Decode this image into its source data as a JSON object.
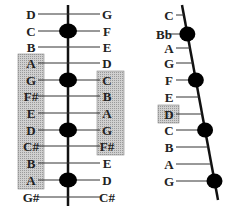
{
  "left_diagram": {
    "colors": {
      "line": "#111111",
      "dot": "#000000",
      "shade": "#c8c8c8",
      "text": "#222222"
    },
    "rows": [
      {
        "left": "D",
        "right": "G",
        "y": 14,
        "dot": false
      },
      {
        "left": "C",
        "right": "F",
        "y": 31,
        "dot": true
      },
      {
        "left": "B",
        "right": "E",
        "y": 47,
        "dot": false
      },
      {
        "left": "A",
        "right": "D",
        "y": 63,
        "dot": false
      },
      {
        "left": "G",
        "right": "C",
        "y": 80,
        "dot": true
      },
      {
        "left": "F#",
        "right": "B",
        "y": 96,
        "dot": false
      },
      {
        "left": "E",
        "right": "A",
        "y": 113,
        "dot": false
      },
      {
        "left": "D",
        "right": "G",
        "y": 130,
        "dot": true
      },
      {
        "left": "C#",
        "right": "F#",
        "y": 146,
        "dot": false
      },
      {
        "left": "B",
        "right": "E",
        "y": 163,
        "dot": false
      },
      {
        "left": "A",
        "right": "D",
        "y": 180,
        "dot": true
      },
      {
        "left": "G#",
        "right": "C#",
        "y": 197,
        "dot": false
      }
    ],
    "shaded_left": {
      "from": "A",
      "to": "A",
      "rows": [
        3,
        10
      ]
    },
    "shaded_right": {
      "from": "C",
      "to": "F#",
      "rows": [
        4,
        8
      ]
    }
  },
  "right_diagram": {
    "rows": [
      {
        "label": "C",
        "y": 15,
        "dot": false
      },
      {
        "label": "Bb",
        "y": 34,
        "dot": true
      },
      {
        "label": "A",
        "y": 48,
        "dot": false
      },
      {
        "label": "G",
        "y": 63,
        "dot": false
      },
      {
        "label": "F",
        "y": 80,
        "dot": true
      },
      {
        "label": "E",
        "y": 97,
        "dot": false
      },
      {
        "label": "D",
        "y": 114,
        "dot": false,
        "shaded": true
      },
      {
        "label": "C",
        "y": 130,
        "dot": true
      },
      {
        "label": "B",
        "y": 147,
        "dot": false
      },
      {
        "label": "A",
        "y": 164,
        "dot": false
      },
      {
        "label": "G",
        "y": 181,
        "dot": true
      }
    ]
  }
}
